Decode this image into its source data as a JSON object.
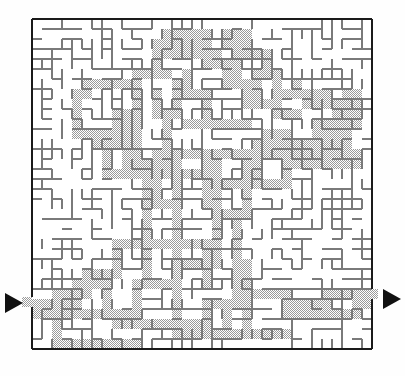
{
  "figure": {
    "kind": "maze-puzzle",
    "width": 405,
    "height": 376,
    "background_color": "#ffffff"
  },
  "maze": {
    "origin_x": 32,
    "origin_y": 19,
    "cols": 34,
    "rows": 33,
    "cell": 10,
    "wall_color": "#7a7a7a",
    "wall_thickness": 1.2,
    "border_color": "#1a1a1a",
    "border_thickness": 2.6,
    "fill_color": "#b0b0b0",
    "fill_label": "explored-region",
    "passage_color": "#ffffff"
  },
  "entrance": {
    "side": "left",
    "label": "entrance",
    "row": 28,
    "gap_y": 297,
    "gap_height": 10
  },
  "exit": {
    "side": "right",
    "label": "exit",
    "row": 28,
    "gap_y": 289,
    "gap_height": 10
  },
  "markers": [
    {
      "name": "entrance-arrow",
      "direction": "right",
      "x": 4,
      "y": 292,
      "width": 18,
      "height": 19,
      "color": "#111111"
    },
    {
      "name": "exit-arrow",
      "direction": "right",
      "x": 382,
      "y": 288,
      "width": 18,
      "height": 19,
      "color": "#111111"
    }
  ],
  "shaded_cells": [
    {
      "c": 0,
      "r": 28,
      "w": 5,
      "h": 1
    },
    {
      "c": 0,
      "r": 29,
      "w": 2,
      "h": 1
    },
    {
      "c": 4,
      "r": 26,
      "w": 1,
      "h": 3
    },
    {
      "c": 5,
      "r": 26,
      "w": 3,
      "h": 1
    },
    {
      "c": 7,
      "r": 26,
      "w": 1,
      "h": 4
    },
    {
      "c": 2,
      "r": 29,
      "w": 6,
      "h": 1
    },
    {
      "c": 2,
      "r": 30,
      "w": 1,
      "h": 3
    },
    {
      "c": 3,
      "r": 32,
      "w": 8,
      "h": 1
    },
    {
      "c": 8,
      "r": 29,
      "w": 3,
      "h": 2
    },
    {
      "c": 10,
      "r": 26,
      "w": 1,
      "h": 5
    },
    {
      "c": 11,
      "r": 26,
      "w": 4,
      "h": 1
    },
    {
      "c": 11,
      "r": 30,
      "w": 6,
      "h": 1
    },
    {
      "c": 14,
      "r": 27,
      "w": 1,
      "h": 5
    },
    {
      "c": 15,
      "r": 31,
      "w": 5,
      "h": 1
    },
    {
      "c": 17,
      "r": 28,
      "w": 1,
      "h": 3
    },
    {
      "c": 18,
      "r": 28,
      "w": 4,
      "h": 1
    },
    {
      "c": 19,
      "r": 29,
      "w": 1,
      "h": 3
    },
    {
      "c": 20,
      "r": 31,
      "w": 6,
      "h": 1
    },
    {
      "c": 21,
      "r": 24,
      "w": 1,
      "h": 7
    },
    {
      "c": 22,
      "r": 27,
      "w": 4,
      "h": 1
    },
    {
      "c": 25,
      "r": 27,
      "w": 1,
      "h": 3
    },
    {
      "c": 25,
      "r": 29,
      "w": 8,
      "h": 1
    },
    {
      "c": 26,
      "r": 28,
      "w": 4,
      "h": 1
    },
    {
      "c": 29,
      "r": 27,
      "w": 5,
      "h": 1
    },
    {
      "c": 32,
      "r": 27,
      "w": 2,
      "h": 2
    },
    {
      "c": 11,
      "r": 18,
      "w": 1,
      "h": 9
    },
    {
      "c": 12,
      "r": 18,
      "w": 3,
      "h": 1
    },
    {
      "c": 12,
      "r": 22,
      "w": 6,
      "h": 1
    },
    {
      "c": 14,
      "r": 18,
      "w": 1,
      "h": 9
    },
    {
      "c": 15,
      "r": 24,
      "w": 4,
      "h": 1
    },
    {
      "c": 17,
      "r": 22,
      "w": 1,
      "h": 5
    },
    {
      "c": 18,
      "r": 19,
      "w": 1,
      "h": 6
    },
    {
      "c": 19,
      "r": 19,
      "w": 3,
      "h": 1
    },
    {
      "c": 20,
      "r": 20,
      "w": 1,
      "h": 8
    },
    {
      "c": 12,
      "r": 13,
      "w": 10,
      "h": 1
    },
    {
      "c": 11,
      "r": 14,
      "w": 1,
      "h": 5
    },
    {
      "c": 12,
      "r": 14,
      "w": 1,
      "h": 4
    },
    {
      "c": 13,
      "r": 14,
      "w": 1,
      "h": 2
    },
    {
      "c": 14,
      "r": 14,
      "w": 1,
      "h": 4
    },
    {
      "c": 15,
      "r": 15,
      "w": 3,
      "h": 1
    },
    {
      "c": 17,
      "r": 14,
      "w": 1,
      "h": 5
    },
    {
      "c": 18,
      "r": 13,
      "w": 1,
      "h": 6
    },
    {
      "c": 19,
      "r": 16,
      "w": 3,
      "h": 1
    },
    {
      "c": 21,
      "r": 13,
      "w": 1,
      "h": 6
    },
    {
      "c": 22,
      "r": 12,
      "w": 10,
      "h": 2
    },
    {
      "c": 23,
      "r": 11,
      "w": 3,
      "h": 1
    },
    {
      "c": 28,
      "r": 10,
      "w": 4,
      "h": 2
    },
    {
      "c": 30,
      "r": 8,
      "w": 3,
      "h": 3
    },
    {
      "c": 24,
      "r": 9,
      "w": 3,
      "h": 1
    },
    {
      "c": 22,
      "r": 8,
      "w": 3,
      "h": 1
    },
    {
      "c": 21,
      "r": 7,
      "w": 2,
      "h": 2
    },
    {
      "c": 20,
      "r": 6,
      "w": 3,
      "h": 1
    },
    {
      "c": 19,
      "r": 5,
      "w": 2,
      "h": 2
    },
    {
      "c": 18,
      "r": 4,
      "w": 2,
      "h": 1
    },
    {
      "c": 17,
      "r": 3,
      "w": 2,
      "h": 2
    },
    {
      "c": 16,
      "r": 2,
      "w": 2,
      "h": 2
    },
    {
      "c": 15,
      "r": 1,
      "w": 3,
      "h": 1
    },
    {
      "c": 13,
      "r": 1,
      "w": 3,
      "h": 3
    },
    {
      "c": 12,
      "r": 2,
      "w": 1,
      "h": 4
    },
    {
      "c": 11,
      "r": 5,
      "w": 3,
      "h": 1
    },
    {
      "c": 10,
      "r": 5,
      "w": 1,
      "h": 9
    },
    {
      "c": 9,
      "r": 6,
      "w": 2,
      "h": 1
    },
    {
      "c": 5,
      "r": 6,
      "w": 5,
      "h": 1
    },
    {
      "c": 4,
      "r": 7,
      "w": 2,
      "h": 1
    },
    {
      "c": 4,
      "r": 8,
      "w": 1,
      "h": 4
    },
    {
      "c": 5,
      "r": 11,
      "w": 4,
      "h": 1
    },
    {
      "c": 8,
      "r": 9,
      "w": 2,
      "h": 3
    },
    {
      "c": 6,
      "r": 12,
      "w": 5,
      "h": 1
    },
    {
      "c": 7,
      "r": 13,
      "w": 1,
      "h": 3
    },
    {
      "c": 8,
      "r": 15,
      "w": 3,
      "h": 1
    },
    {
      "c": 9,
      "r": 13,
      "w": 2,
      "h": 3
    },
    {
      "c": 19,
      "r": 1,
      "w": 2,
      "h": 2
    },
    {
      "c": 20,
      "r": 2,
      "w": 1,
      "h": 4
    },
    {
      "c": 21,
      "r": 1,
      "w": 1,
      "h": 3
    },
    {
      "c": 22,
      "r": 3,
      "w": 2,
      "h": 1
    },
    {
      "c": 23,
      "r": 4,
      "w": 1,
      "h": 2
    },
    {
      "c": 22,
      "r": 5,
      "w": 2,
      "h": 1
    },
    {
      "c": 24,
      "r": 5,
      "w": 1,
      "h": 3
    },
    {
      "c": 25,
      "r": 7,
      "w": 4,
      "h": 1
    },
    {
      "c": 26,
      "r": 6,
      "w": 1,
      "h": 2
    },
    {
      "c": 27,
      "r": 8,
      "w": 3,
      "h": 1
    },
    {
      "c": 29,
      "r": 7,
      "w": 1,
      "h": 2
    },
    {
      "c": 31,
      "r": 7,
      "w": 2,
      "h": 1
    },
    {
      "c": 12,
      "r": 7,
      "w": 1,
      "h": 3
    },
    {
      "c": 13,
      "r": 9,
      "w": 2,
      "h": 1
    },
    {
      "c": 14,
      "r": 6,
      "w": 1,
      "h": 4
    },
    {
      "c": 15,
      "r": 10,
      "w": 3,
      "h": 1
    },
    {
      "c": 15,
      "r": 5,
      "w": 1,
      "h": 3
    },
    {
      "c": 16,
      "r": 7,
      "w": 2,
      "h": 1
    },
    {
      "c": 17,
      "r": 8,
      "w": 1,
      "h": 3
    },
    {
      "c": 18,
      "r": 10,
      "w": 4,
      "h": 1
    },
    {
      "c": 13,
      "r": 10,
      "w": 1,
      "h": 4
    },
    {
      "c": 8,
      "r": 22,
      "w": 4,
      "h": 1
    },
    {
      "c": 8,
      "r": 23,
      "w": 1,
      "h": 3
    },
    {
      "c": 5,
      "r": 25,
      "w": 4,
      "h": 1
    },
    {
      "c": 5,
      "r": 26,
      "w": 1,
      "h": 2
    },
    {
      "c": 2,
      "r": 27,
      "w": 4,
      "h": 1
    },
    {
      "c": 22,
      "r": 14,
      "w": 1,
      "h": 3
    },
    {
      "c": 23,
      "r": 16,
      "w": 3,
      "h": 1
    },
    {
      "c": 25,
      "r": 14,
      "w": 1,
      "h": 3
    },
    {
      "c": 26,
      "r": 14,
      "w": 6,
      "h": 1
    },
    {
      "c": 31,
      "r": 13,
      "w": 2,
      "h": 2
    }
  ]
}
